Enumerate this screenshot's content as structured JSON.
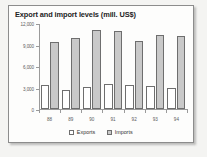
{
  "chart_data": {
    "type": "bar",
    "title": "Export and import levels (mill. US$)",
    "xlabel": "",
    "ylabel": "",
    "categories": [
      "88",
      "89",
      "90",
      "91",
      "92",
      "93",
      "94"
    ],
    "series": [
      {
        "name": "Exports",
        "color": "#ffffff",
        "values": [
          3300,
          2600,
          3100,
          3500,
          3300,
          3200,
          3000
        ]
      },
      {
        "name": "Imports",
        "color": "#c9c9c9",
        "values": [
          9400,
          9900,
          11000,
          10900,
          9500,
          10300,
          10200
        ]
      }
    ],
    "ylim": [
      0,
      12000
    ],
    "yticks": [
      0,
      3000,
      6000,
      9000,
      12000
    ],
    "ytick_labels": [
      "0",
      "3,000",
      "6,000",
      "9,000",
      "12,000"
    ],
    "grid": false,
    "legend_position": "bottom"
  },
  "legend": {
    "items": [
      {
        "label": "Exports",
        "swatch": "exports-swatch"
      },
      {
        "label": "Imports",
        "swatch": "imports-swatch"
      }
    ]
  }
}
